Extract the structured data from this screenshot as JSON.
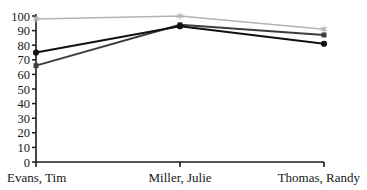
{
  "chart_data": {
    "type": "line",
    "title": "",
    "clipped_top_text": "",
    "xlabel": "",
    "ylabel": "",
    "categories": [
      "Evans, Tim",
      "Miller, Julie",
      "Thomas, Randy"
    ],
    "ylim": [
      0,
      100
    ],
    "yticks": [
      0,
      10,
      20,
      30,
      40,
      50,
      60,
      70,
      80,
      90,
      100
    ],
    "ytick_labels": [
      "0",
      "10",
      "20",
      "30",
      "40",
      "50",
      "60",
      "70",
      "80",
      "90",
      "100"
    ],
    "grid": false,
    "legend": "none",
    "series": [
      {
        "name": "Series 1",
        "marker": "star",
        "color": "#b3b3b3",
        "values": [
          98,
          100,
          91
        ]
      },
      {
        "name": "Series 2",
        "marker": "square",
        "color": "#3d3d3d",
        "values": [
          66,
          94,
          87
        ]
      },
      {
        "name": "Series 3",
        "marker": "circle",
        "color": "#111111",
        "values": [
          75,
          93,
          81
        ]
      }
    ],
    "axis_color": "#1a1a1a"
  },
  "axes": {
    "x_tick_positions": [
      36,
      180,
      324
    ],
    "plot_left": 36,
    "plot_right": 324,
    "plot_top": 16,
    "plot_bottom": 162
  }
}
